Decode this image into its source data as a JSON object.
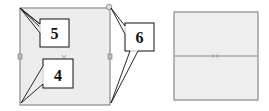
{
  "callouts": [
    {
      "id": "5",
      "label": "5"
    },
    {
      "id": "4",
      "label": "4"
    },
    {
      "id": "6",
      "label": "6"
    }
  ],
  "colors": {
    "frame_fill": "#ededed",
    "frame_stroke": "#8a8a8a",
    "callout_stroke": "#111111",
    "callout_fill": "#ffffff"
  }
}
